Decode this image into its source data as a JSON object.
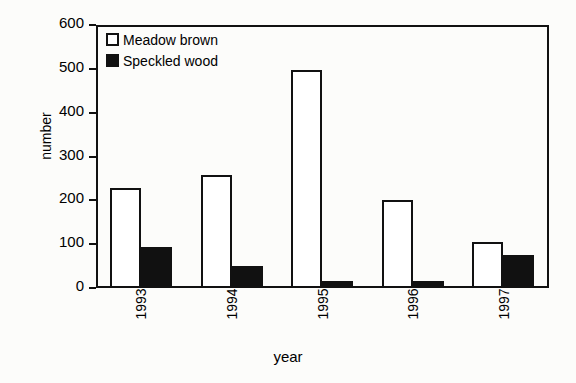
{
  "chart_data": {
    "type": "bar",
    "title": "",
    "xlabel": "year",
    "ylabel": "number",
    "categories": [
      "1993",
      "1994",
      "1995",
      "1996",
      "1997"
    ],
    "series": [
      {
        "name": "Meadow brown",
        "style": "open",
        "values": [
          228,
          257,
          497,
          200,
          105
        ]
      },
      {
        "name": "Speckled wood",
        "style": "filled",
        "values": [
          93,
          50,
          17,
          15,
          75
        ]
      }
    ],
    "ylim": [
      0,
      600
    ],
    "yticks": [
      0,
      100,
      200,
      300,
      400,
      500,
      600
    ],
    "ytick_labels": [
      "0",
      "100",
      "200",
      "300",
      "400",
      "500",
      "600"
    ],
    "grid": false,
    "legend_position": "top-left-inside",
    "xtick_rotation": 90,
    "frame": "full-box",
    "colors": {
      "series_open_fill": "#ffffff",
      "series_filled_fill": "#111111",
      "axis": "#111111",
      "background": "#fcfcfa"
    }
  },
  "legend": {
    "entries": [
      {
        "label": "Meadow brown",
        "style": "open"
      },
      {
        "label": "Speckled wood",
        "style": "filled"
      }
    ]
  }
}
